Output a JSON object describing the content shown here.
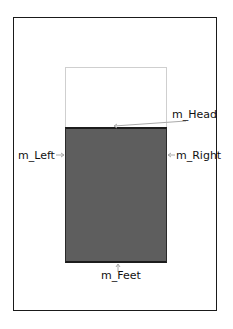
{
  "diagram": {
    "labels": {
      "head": "m_Head",
      "left": "m_Left",
      "right": "m_Right",
      "feet": "m_Feet"
    },
    "colors": {
      "frame": "#1a1a1a",
      "body_fill": "#5e5e5e",
      "head_border": "#cfcfcf",
      "pointer": "#aaaaaa"
    }
  }
}
